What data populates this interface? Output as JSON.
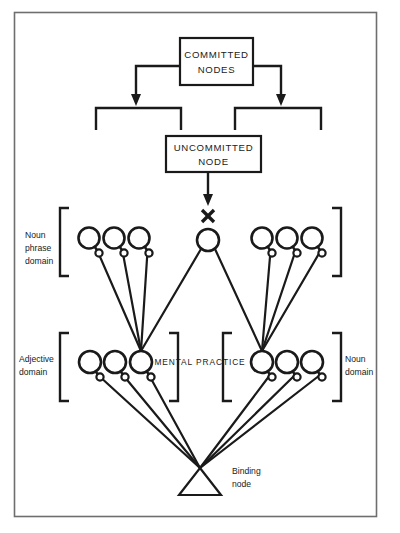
{
  "figure": {
    "background_color": "#ffffff",
    "ink_color": "#1a1a1a",
    "frame_color": "#6e6e6e"
  },
  "boxes": {
    "committed": {
      "line1": "COMMITTED",
      "line2": "NODES"
    },
    "uncommitted": {
      "line1": "UNCOMMITTED",
      "line2": "NODE"
    }
  },
  "labels": {
    "noun_phrase_domain": {
      "line1": "Noun",
      "line2": "phrase",
      "line3": "domain"
    },
    "adjective_domain": {
      "line1": "Adjective",
      "line2": "domain"
    },
    "noun_domain": {
      "line1": "Noun",
      "line2": "domain"
    },
    "mental_practice": "MENTAL PRACTICE",
    "binding_node": {
      "line1": "Binding",
      "line2": "node"
    }
  },
  "markers": {
    "blocked_connection": "X"
  },
  "nodes": {
    "noun_phrase_row": {
      "y": 238,
      "radius": 10.5,
      "left_group_x": [
        89,
        114,
        139
      ],
      "right_group_x": [
        262,
        287,
        312
      ]
    },
    "center_node": {
      "x": 208,
      "y": 240,
      "radius": 11
    },
    "domain_row": {
      "y": 362,
      "radius": 11,
      "adjective_group_x": [
        90,
        115,
        141
      ],
      "noun_group_x": [
        262,
        287,
        312
      ]
    },
    "binding_node": {
      "apex_x": 200,
      "apex_y": 468,
      "base_y": 495,
      "half_width": 21
    }
  },
  "brackets": {
    "noun_phrase_left": {
      "x": 60,
      "y": 208,
      "w": 9,
      "h": 68,
      "facing": "right"
    },
    "noun_phrase_right": {
      "x": 332,
      "y": 208,
      "w": 9,
      "h": 68,
      "facing": "left"
    },
    "adjective_left": {
      "x": 60,
      "y": 333,
      "w": 9,
      "h": 68,
      "facing": "right"
    },
    "adjective_right": {
      "x": 160,
      "y": 333,
      "w": 9,
      "h": 68,
      "facing": "left"
    },
    "noun_left": {
      "x": 228,
      "y": 333,
      "w": 9,
      "h": 68,
      "facing": "right"
    },
    "noun_right": {
      "x": 332,
      "y": 333,
      "w": 9,
      "h": 68,
      "facing": "left"
    }
  }
}
